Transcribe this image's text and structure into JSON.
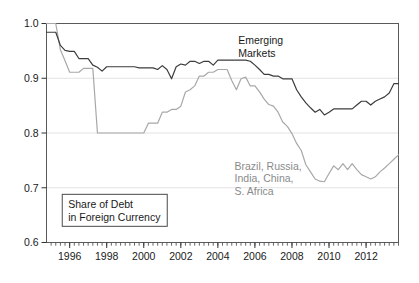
{
  "chart_data": {
    "type": "line",
    "title": "",
    "subtitle": "",
    "xlabel": "",
    "ylabel": "",
    "xlim": [
      1994.75,
      2013.75
    ],
    "ylim": [
      0.6,
      1.0
    ],
    "grid": true,
    "grid_axis": "y",
    "legend_position": "inline-annotation",
    "y_ticks": [
      "0.6",
      "0.7",
      "0.8",
      "0.9",
      "1.0"
    ],
    "y_tick_values": [
      0.6,
      0.7,
      0.8,
      0.9,
      1.0
    ],
    "x_ticks": [
      "1996",
      "1998",
      "2000",
      "2002",
      "2004",
      "2006",
      "2008",
      "2010",
      "2012"
    ],
    "x_tick_values": [
      1996,
      1998,
      2000,
      2002,
      2004,
      2006,
      2008,
      2010,
      2012
    ],
    "x_minor_tick_interval": 0.25,
    "annotations": [
      {
        "name": "emerging-markets-label",
        "lines": [
          "Emerging",
          "Markets"
        ],
        "x": 2005.1,
        "y": 0.962,
        "color": "#1a1a1a"
      },
      {
        "name": "brics-label",
        "lines": [
          "Brazil, Russia,",
          "India, China,",
          "S. Africa"
        ],
        "x": 2004.9,
        "y": 0.733,
        "color": "#8a8a8a"
      }
    ],
    "boxed_caption": {
      "lines": [
        "Share of Debt",
        "in Foreign Currency"
      ],
      "x": 1995.6,
      "y": 0.688
    },
    "series": [
      {
        "name": "Emerging Markets",
        "color": "#3c3c3c",
        "width": 1.2,
        "x": [
          1994.75,
          1995.0,
          1995.25,
          1995.5,
          1995.75,
          1996.0,
          1996.25,
          1996.5,
          1996.75,
          1997.0,
          1997.25,
          1997.5,
          1997.75,
          1998.0,
          1998.25,
          1998.5,
          1998.75,
          1999.0,
          1999.25,
          1999.5,
          1999.75,
          2000.0,
          2000.25,
          2000.5,
          2000.75,
          2001.0,
          2001.25,
          2001.5,
          2001.75,
          2002.0,
          2002.25,
          2002.5,
          2002.75,
          2003.0,
          2003.25,
          2003.5,
          2003.75,
          2004.0,
          2004.25,
          2004.5,
          2004.75,
          2005.0,
          2005.25,
          2005.5,
          2005.75,
          2006.0,
          2006.25,
          2006.5,
          2006.75,
          2007.0,
          2007.25,
          2007.5,
          2007.75,
          2008.0,
          2008.25,
          2008.5,
          2008.75,
          2009.0,
          2009.25,
          2009.5,
          2009.75,
          2010.0,
          2010.25,
          2010.5,
          2010.75,
          2011.0,
          2011.25,
          2011.5,
          2011.75,
          2012.0,
          2012.25,
          2012.5,
          2012.75,
          2013.0,
          2013.25,
          2013.5,
          2013.75
        ],
        "y": [
          0.984,
          0.984,
          0.984,
          0.96,
          0.951,
          0.949,
          0.949,
          0.936,
          0.936,
          0.936,
          0.924,
          0.92,
          0.913,
          0.921,
          0.921,
          0.921,
          0.921,
          0.921,
          0.921,
          0.921,
          0.919,
          0.919,
          0.919,
          0.919,
          0.916,
          0.923,
          0.916,
          0.899,
          0.921,
          0.926,
          0.924,
          0.931,
          0.931,
          0.927,
          0.931,
          0.931,
          0.924,
          0.933,
          0.933,
          0.933,
          0.933,
          0.933,
          0.933,
          0.933,
          0.931,
          0.924,
          0.916,
          0.907,
          0.907,
          0.904,
          0.904,
          0.899,
          0.899,
          0.899,
          0.879,
          0.866,
          0.855,
          0.846,
          0.838,
          0.843,
          0.833,
          0.838,
          0.844,
          0.844,
          0.844,
          0.844,
          0.844,
          0.851,
          0.858,
          0.858,
          0.851,
          0.858,
          0.862,
          0.866,
          0.873,
          0.89,
          0.89
        ]
      },
      {
        "name": "Brazil, Russia, India, China, S. Africa",
        "color": "#a8a8a8",
        "width": 1.2,
        "x": [
          1994.75,
          1995.0,
          1995.25,
          1995.5,
          1995.75,
          1996.0,
          1996.25,
          1996.5,
          1996.75,
          1997.0,
          1997.25,
          1997.5,
          1997.75,
          1998.0,
          1998.25,
          1998.5,
          1998.75,
          1999.0,
          1999.25,
          1999.5,
          1999.75,
          2000.0,
          2000.25,
          2000.5,
          2000.75,
          2001.0,
          2001.25,
          2001.5,
          2001.75,
          2002.0,
          2002.25,
          2002.5,
          2002.75,
          2003.0,
          2003.25,
          2003.5,
          2003.75,
          2004.0,
          2004.25,
          2004.5,
          2004.75,
          2005.0,
          2005.25,
          2005.5,
          2005.75,
          2006.0,
          2006.25,
          2006.5,
          2006.75,
          2007.0,
          2007.25,
          2007.5,
          2007.75,
          2008.0,
          2008.25,
          2008.5,
          2008.75,
          2009.0,
          2009.25,
          2009.5,
          2009.75,
          2010.0,
          2010.25,
          2010.5,
          2010.75,
          2011.0,
          2011.25,
          2011.5,
          2011.75,
          2012.0,
          2012.25,
          2012.5,
          2012.75,
          2013.0,
          2013.25,
          2013.5,
          2013.75
        ],
        "y": [
          1.0,
          1.0,
          1.0,
          0.952,
          0.932,
          0.911,
          0.911,
          0.911,
          0.918,
          0.918,
          0.918,
          0.8,
          0.8,
          0.8,
          0.8,
          0.8,
          0.8,
          0.8,
          0.8,
          0.8,
          0.8,
          0.8,
          0.818,
          0.818,
          0.818,
          0.838,
          0.838,
          0.843,
          0.843,
          0.849,
          0.875,
          0.879,
          0.886,
          0.904,
          0.904,
          0.911,
          0.911,
          0.916,
          0.916,
          0.916,
          0.896,
          0.879,
          0.899,
          0.902,
          0.886,
          0.886,
          0.875,
          0.862,
          0.852,
          0.849,
          0.838,
          0.82,
          0.812,
          0.799,
          0.781,
          0.768,
          0.742,
          0.729,
          0.716,
          0.712,
          0.711,
          0.726,
          0.74,
          0.733,
          0.744,
          0.733,
          0.744,
          0.733,
          0.724,
          0.72,
          0.716,
          0.72,
          0.729,
          0.736,
          0.744,
          0.752,
          0.76
        ]
      }
    ],
    "colors": {
      "emerging_markets": "#3c3c3c",
      "brics": "#a8a8a8",
      "frame": "#5a5a5a",
      "grid": "#e2e2e2",
      "background": "#ffffff",
      "text": "#1a1a1a",
      "muted_text": "#8a8a8a"
    }
  }
}
